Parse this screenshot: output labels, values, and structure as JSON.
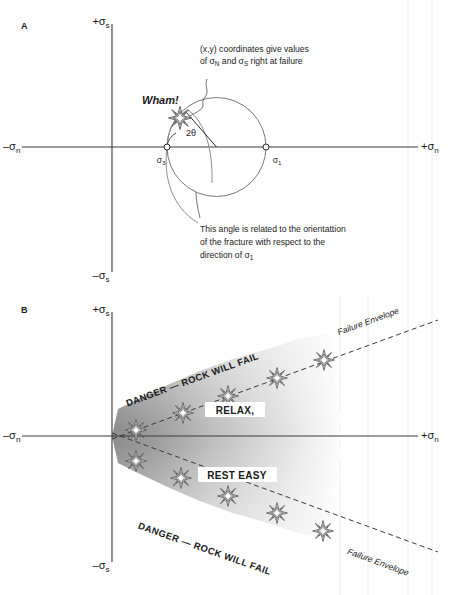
{
  "figure": {
    "panels": [
      {
        "id": "A",
        "label": "A",
        "axes": {
          "y_pos": "+σ",
          "y_pos_sub": "s",
          "y_neg": "–σ",
          "y_neg_sub": "s",
          "x_neg": "–σ",
          "x_neg_sub": "n",
          "x_pos": "+σ",
          "x_pos_sub": "n"
        },
        "mohr_circle": {
          "sigma3_label": "σ",
          "sigma3_sub": "3",
          "sigma1_label": "σ",
          "sigma1_sub": "1",
          "angle_label": "2θ"
        },
        "burst_label": "Wham!",
        "annotation_top": {
          "line1": "(x,y) coordinates give values",
          "line2_a": "of σ",
          "line2_sub_a": "N",
          "line2_b": " and  σ",
          "line2_sub_b": "S",
          "line2_c": " right at failure"
        },
        "annotation_bottom": {
          "line1": "This angle is related to the orientattion",
          "line2": "of the fracture with respect to the",
          "line3": "direction of σ",
          "line3_sub": "1"
        }
      },
      {
        "id": "B",
        "label": "B",
        "axes": {
          "y_pos": "+σ",
          "y_pos_sub": "s",
          "y_neg": "–σ",
          "y_neg_sub": "s",
          "x_neg": "–σ",
          "x_neg_sub": "n",
          "x_pos": "+σ",
          "x_pos_sub": "n"
        },
        "upper_envelope_text": "DANGER — ROCK  WILL  FAIL",
        "lower_envelope_text": "DANGER — ROCK  WILL  FAIL",
        "upper_envelope_name": "Failure Envelope",
        "lower_envelope_name": "Failure Envelope",
        "zone_upper": "RELAX,",
        "zone_lower": "REST EASY"
      }
    ],
    "colors": {
      "ink": "#1a1a1a",
      "axis": "#3a3a3a",
      "circle": "#6b6b6b",
      "envelope": "#4a4a4a",
      "fill_dark": "#8e8e8e",
      "background": "#ffffff",
      "guide": "#ececec"
    }
  }
}
